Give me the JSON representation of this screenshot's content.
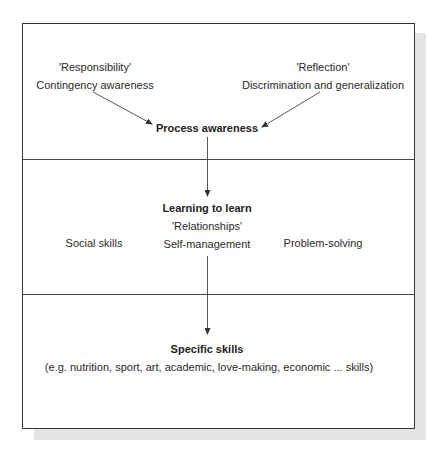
{
  "diagram": {
    "type": "layered-flow",
    "panels": [
      {
        "id": "top",
        "left_group": {
          "quote": "'Responsibility'",
          "label": "Contingency awareness"
        },
        "right_group": {
          "quote": "'Reflection'",
          "label": "Discrimination and generalization"
        },
        "target": "Process awareness"
      },
      {
        "id": "middle",
        "title": "Learning to learn",
        "quote": "'Relationships'",
        "left": "Social skills",
        "center": "Self-management",
        "right": "Problem-solving"
      },
      {
        "id": "bottom",
        "title": "Specific skills",
        "examples": "(e.g. nutrition, sport, art, academic, love-making, economic ... skills)"
      }
    ],
    "edges": [
      {
        "from": "Contingency awareness",
        "to": "Process awareness"
      },
      {
        "from": "Discrimination and generalization",
        "to": "Process awareness"
      },
      {
        "from": "Process awareness",
        "to": "Learning to learn"
      },
      {
        "from": "Self-management",
        "to": "Specific skills"
      }
    ],
    "colors": {
      "line": "#333333",
      "text": "#2a2a2a",
      "shadow": "#e4e4e4"
    }
  }
}
